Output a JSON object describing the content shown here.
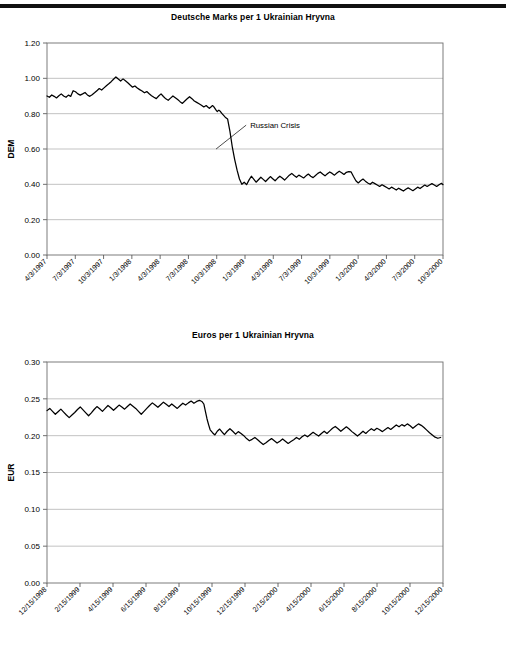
{
  "page": {
    "top_rule": "horizontal-rule"
  },
  "chart_data": [
    {
      "id": "dem",
      "type": "line",
      "title": "Deutsche Marks per 1 Ukrainian Hryvna",
      "xlabel": "",
      "ylabel": "DEM",
      "ylim": [
        0.0,
        1.2
      ],
      "yticks": [
        0.0,
        0.2,
        0.4,
        0.6,
        0.8,
        1.0,
        1.2
      ],
      "ytick_labels": [
        "0.00",
        "0.20",
        "0.40",
        "0.60",
        "0.80",
        "1.00",
        "1.20"
      ],
      "grid": true,
      "legend": "none",
      "xtick_labels": [
        "4/3/1997",
        "7/3/1997",
        "10/3/1997",
        "1/3/1998",
        "4/3/1998",
        "7/3/1998",
        "10/3/1998",
        "1/3/1999",
        "4/3/1999",
        "7/3/1999",
        "10/3/1999",
        "1/3/2000",
        "4/3/2000",
        "7/3/2000",
        "10/3/2000"
      ],
      "annotations": [
        {
          "text": "Russian Crisis",
          "x_frac": 0.513,
          "y_value": 0.735,
          "point_x_frac": 0.427,
          "point_y_value": 0.6
        }
      ],
      "x": [
        0,
        0.006,
        0.012,
        0.018,
        0.024,
        0.03,
        0.036,
        0.042,
        0.048,
        0.054,
        0.06,
        0.066,
        0.072,
        0.078,
        0.084,
        0.09,
        0.096,
        0.102,
        0.108,
        0.114,
        0.12,
        0.126,
        0.132,
        0.138,
        0.144,
        0.15,
        0.156,
        0.162,
        0.168,
        0.174,
        0.18,
        0.186,
        0.192,
        0.198,
        0.204,
        0.21,
        0.216,
        0.222,
        0.228,
        0.234,
        0.24,
        0.246,
        0.252,
        0.258,
        0.264,
        0.27,
        0.276,
        0.282,
        0.288,
        0.294,
        0.3,
        0.306,
        0.312,
        0.318,
        0.324,
        0.33,
        0.336,
        0.342,
        0.348,
        0.354,
        0.36,
        0.366,
        0.372,
        0.378,
        0.384,
        0.39,
        0.396,
        0.402,
        0.406,
        0.41,
        0.414,
        0.418,
        0.421,
        0.424,
        0.427,
        0.43,
        0.434,
        0.438,
        0.442,
        0.446,
        0.45,
        0.456,
        0.462,
        0.468,
        0.474,
        0.48,
        0.486,
        0.492,
        0.498,
        0.504,
        0.51,
        0.516,
        0.522,
        0.528,
        0.534,
        0.54,
        0.546,
        0.552,
        0.558,
        0.564,
        0.57,
        0.576,
        0.582,
        0.588,
        0.594,
        0.6,
        0.606,
        0.612,
        0.618,
        0.624,
        0.63,
        0.636,
        0.642,
        0.648,
        0.654,
        0.66,
        0.666,
        0.672,
        0.678,
        0.684,
        0.69,
        0.696,
        0.702,
        0.708,
        0.714,
        0.72,
        0.726,
        0.732,
        0.738,
        0.744,
        0.75,
        0.756,
        0.762,
        0.768,
        0.774,
        0.78,
        0.786,
        0.792,
        0.798,
        0.804,
        0.81,
        0.816,
        0.822,
        0.828,
        0.834,
        0.84,
        0.846,
        0.852,
        0.858,
        0.864,
        0.87,
        0.876,
        0.882,
        0.888,
        0.894,
        0.9,
        0.906,
        0.912,
        0.918,
        0.924,
        0.93,
        0.936,
        0.942,
        0.948,
        0.954,
        0.96,
        0.966,
        0.972,
        0.978,
        0.984,
        0.99,
        0.996,
        1.0
      ],
      "y": [
        0.9,
        0.893,
        0.906,
        0.898,
        0.889,
        0.901,
        0.912,
        0.9,
        0.893,
        0.905,
        0.898,
        0.93,
        0.924,
        0.912,
        0.905,
        0.912,
        0.92,
        0.906,
        0.898,
        0.907,
        0.918,
        0.93,
        0.942,
        0.934,
        0.946,
        0.958,
        0.969,
        0.981,
        0.995,
        1.008,
        0.996,
        0.985,
        0.997,
        0.986,
        0.975,
        0.962,
        0.95,
        0.957,
        0.945,
        0.936,
        0.928,
        0.918,
        0.925,
        0.913,
        0.902,
        0.893,
        0.885,
        0.9,
        0.912,
        0.897,
        0.884,
        0.876,
        0.888,
        0.9,
        0.89,
        0.88,
        0.868,
        0.858,
        0.872,
        0.884,
        0.896,
        0.885,
        0.872,
        0.864,
        0.856,
        0.848,
        0.838,
        0.846,
        0.838,
        0.83,
        0.838,
        0.846,
        0.84,
        0.83,
        0.82,
        0.812,
        0.82,
        0.812,
        0.8,
        0.79,
        0.78,
        0.77,
        0.7,
        0.61,
        0.54,
        0.48,
        0.43,
        0.4,
        0.412,
        0.398,
        0.424,
        0.446,
        0.43,
        0.412,
        0.426,
        0.44,
        0.428,
        0.416,
        0.43,
        0.444,
        0.432,
        0.42,
        0.434,
        0.446,
        0.436,
        0.424,
        0.438,
        0.452,
        0.462,
        0.45,
        0.44,
        0.452,
        0.444,
        0.436,
        0.448,
        0.458,
        0.446,
        0.438,
        0.45,
        0.462,
        0.47,
        0.458,
        0.448,
        0.46,
        0.47,
        0.462,
        0.452,
        0.464,
        0.474,
        0.466,
        0.456,
        0.468,
        0.472,
        0.47,
        0.444,
        0.42,
        0.408,
        0.42,
        0.43,
        0.418,
        0.408,
        0.4,
        0.412,
        0.404,
        0.396,
        0.388,
        0.398,
        0.39,
        0.382,
        0.374,
        0.384,
        0.376,
        0.368,
        0.378,
        0.37,
        0.362,
        0.372,
        0.38,
        0.372,
        0.364,
        0.374,
        0.384,
        0.376,
        0.386,
        0.396,
        0.388,
        0.396,
        0.404,
        0.396,
        0.388,
        0.398,
        0.406,
        0.398,
        0.39,
        0.4,
        0.408,
        0.4,
        0.392,
        0.386
      ]
    },
    {
      "id": "eur",
      "type": "line",
      "title": "Euros per 1 Ukrainian Hryvna",
      "xlabel": "",
      "ylabel": "EUR",
      "ylim": [
        0.0,
        0.3
      ],
      "yticks": [
        0.0,
        0.05,
        0.1,
        0.15,
        0.2,
        0.25,
        0.3
      ],
      "ytick_labels": [
        "0.00",
        "0.05",
        "0.10",
        "0.15",
        "0.20",
        "0.25",
        "0.30"
      ],
      "grid": true,
      "legend": "none",
      "xtick_labels": [
        "12/15/1998",
        "2/15/1999",
        "4/15/1999",
        "6/15/1999",
        "8/15/1999",
        "10/15/1999",
        "12/15/1999",
        "2/15/2000",
        "4/15/2000",
        "6/15/2000",
        "8/15/2000",
        "10/15/2000",
        "12/15/2000"
      ],
      "annotations": [],
      "x": [
        0,
        0.007,
        0.014,
        0.021,
        0.028,
        0.035,
        0.042,
        0.049,
        0.056,
        0.063,
        0.07,
        0.077,
        0.084,
        0.091,
        0.098,
        0.105,
        0.112,
        0.119,
        0.126,
        0.133,
        0.14,
        0.147,
        0.154,
        0.161,
        0.168,
        0.175,
        0.182,
        0.189,
        0.196,
        0.203,
        0.21,
        0.217,
        0.224,
        0.231,
        0.238,
        0.245,
        0.252,
        0.259,
        0.266,
        0.273,
        0.28,
        0.287,
        0.294,
        0.301,
        0.308,
        0.315,
        0.322,
        0.329,
        0.336,
        0.343,
        0.35,
        0.357,
        0.364,
        0.371,
        0.378,
        0.385,
        0.392,
        0.396,
        0.4,
        0.404,
        0.408,
        0.412,
        0.418,
        0.424,
        0.43,
        0.436,
        0.442,
        0.448,
        0.455,
        0.462,
        0.469,
        0.476,
        0.483,
        0.49,
        0.497,
        0.504,
        0.511,
        0.518,
        0.525,
        0.532,
        0.539,
        0.546,
        0.553,
        0.56,
        0.567,
        0.574,
        0.581,
        0.588,
        0.595,
        0.602,
        0.609,
        0.616,
        0.623,
        0.63,
        0.637,
        0.644,
        0.651,
        0.658,
        0.665,
        0.672,
        0.679,
        0.686,
        0.693,
        0.7,
        0.707,
        0.714,
        0.721,
        0.728,
        0.735,
        0.742,
        0.749,
        0.756,
        0.763,
        0.77,
        0.777,
        0.784,
        0.791,
        0.798,
        0.805,
        0.812,
        0.819,
        0.826,
        0.833,
        0.84,
        0.847,
        0.854,
        0.861,
        0.868,
        0.875,
        0.882,
        0.889,
        0.896,
        0.903,
        0.91,
        0.917,
        0.924,
        0.931,
        0.938,
        0.945,
        0.952,
        0.959,
        0.966,
        0.973,
        0.98,
        0.987,
        0.994,
        1.0
      ],
      "y": [
        0.234,
        0.237,
        0.233,
        0.229,
        0.2325,
        0.236,
        0.232,
        0.228,
        0.2245,
        0.228,
        0.2315,
        0.2355,
        0.239,
        0.235,
        0.231,
        0.227,
        0.231,
        0.2355,
        0.2395,
        0.2365,
        0.233,
        0.237,
        0.241,
        0.238,
        0.2345,
        0.238,
        0.2415,
        0.239,
        0.236,
        0.2395,
        0.243,
        0.24,
        0.237,
        0.233,
        0.229,
        0.233,
        0.237,
        0.241,
        0.2445,
        0.2415,
        0.2385,
        0.242,
        0.2455,
        0.2425,
        0.2395,
        0.243,
        0.24,
        0.237,
        0.2405,
        0.244,
        0.2415,
        0.2445,
        0.247,
        0.244,
        0.2465,
        0.248,
        0.246,
        0.243,
        0.233,
        0.223,
        0.215,
        0.208,
        0.204,
        0.201,
        0.206,
        0.209,
        0.205,
        0.2015,
        0.206,
        0.2095,
        0.206,
        0.202,
        0.2055,
        0.203,
        0.2,
        0.196,
        0.193,
        0.195,
        0.1975,
        0.1945,
        0.191,
        0.188,
        0.1905,
        0.1935,
        0.196,
        0.193,
        0.19,
        0.1925,
        0.1955,
        0.1925,
        0.1895,
        0.192,
        0.1945,
        0.1975,
        0.195,
        0.1985,
        0.201,
        0.1985,
        0.2015,
        0.2045,
        0.202,
        0.1995,
        0.203,
        0.206,
        0.203,
        0.2065,
        0.21,
        0.2125,
        0.2095,
        0.206,
        0.209,
        0.212,
        0.209,
        0.2055,
        0.2025,
        0.1995,
        0.2025,
        0.206,
        0.203,
        0.2065,
        0.2095,
        0.207,
        0.21,
        0.208,
        0.2055,
        0.2085,
        0.211,
        0.2085,
        0.2115,
        0.2145,
        0.212,
        0.215,
        0.213,
        0.216,
        0.2135,
        0.21,
        0.213,
        0.216,
        0.214,
        0.211,
        0.2075,
        0.204,
        0.201,
        0.198,
        0.1965,
        0.1975
      ]
    }
  ]
}
